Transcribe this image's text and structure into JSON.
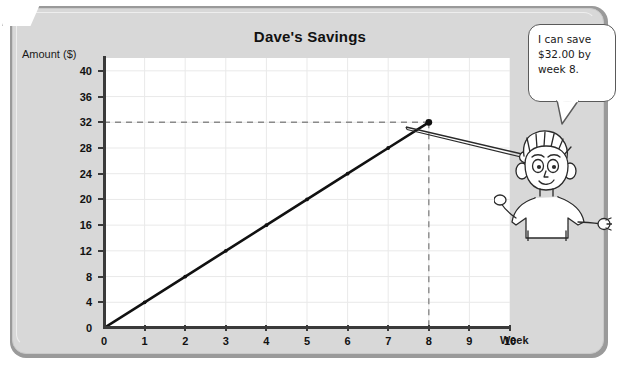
{
  "chart_data": {
    "type": "line",
    "title": "Dave's Savings",
    "xlabel": "Week",
    "ylabel": "Amount ($)",
    "x": [
      0,
      1,
      2,
      3,
      4,
      5,
      6,
      7,
      8
    ],
    "values": [
      0,
      4,
      8,
      12,
      16,
      20,
      24,
      28,
      32
    ],
    "xticks": [
      "0",
      "1",
      "2",
      "3",
      "4",
      "5",
      "6",
      "7",
      "8",
      "9",
      "10"
    ],
    "yticks": [
      "0",
      "4",
      "8",
      "12",
      "16",
      "20",
      "24",
      "28",
      "32",
      "36",
      "40"
    ],
    "xlim": [
      0,
      10
    ],
    "ylim": [
      0,
      42
    ],
    "grid": true,
    "legend": "none",
    "annotations": [
      {
        "type": "guide-line",
        "orientation": "horizontal",
        "value": 32,
        "style": "dashed"
      },
      {
        "type": "guide-line",
        "orientation": "vertical",
        "value": 8,
        "style": "dashed"
      },
      {
        "type": "highlight-point",
        "x": 8,
        "y": 32
      }
    ],
    "series_color": "#111111",
    "grid_color": "#e9e9e9"
  },
  "speech_bubble": {
    "line1": "I can save",
    "line2": "$32.00 by",
    "line3": "week 8."
  },
  "character": {
    "name": "boy-with-pointer"
  },
  "colors": {
    "frame": "#d8d8d8",
    "frame_border": "#9a9a9a",
    "plot_background": "#ffffff",
    "axis": "#3a3a3a",
    "text": "#111111"
  }
}
